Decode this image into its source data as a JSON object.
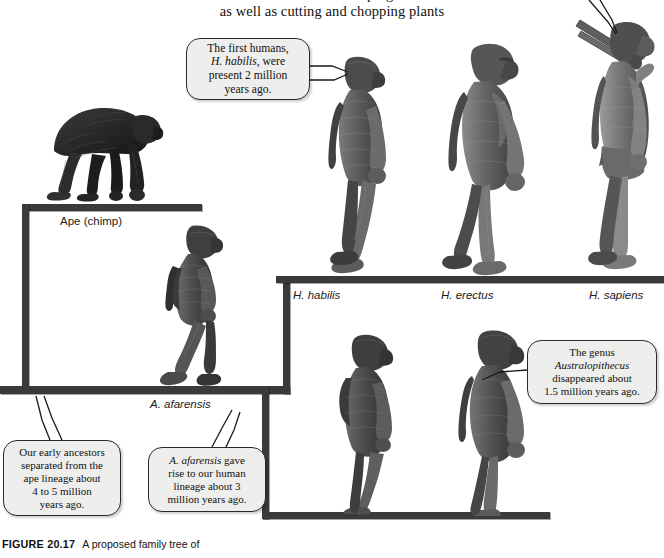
{
  "page": {
    "body_text_lines": [
      "tools were used for scraping animal",
      "as well as cutting and chopping plants"
    ]
  },
  "caption": {
    "figure_number": "FIGURE 20.17",
    "text": "A proposed family tree of"
  },
  "tree": {
    "labels": [
      {
        "id": "ape",
        "text": "Ape (chimp)",
        "italic": false,
        "x": 60,
        "y": 215
      },
      {
        "id": "afarensis",
        "text": "A. afarensis",
        "italic": true,
        "x": 150,
        "y": 398
      },
      {
        "id": "habilis",
        "text": "H. habilis",
        "italic": true,
        "x": 293,
        "y": 289
      },
      {
        "id": "erectus",
        "text": "H. erectus",
        "italic": true,
        "x": 441,
        "y": 289
      },
      {
        "id": "sapiens",
        "text": "H. sapiens",
        "italic": true,
        "x": 589,
        "y": 289
      }
    ]
  },
  "callouts": [
    {
      "id": "first-humans",
      "lines": [
        "The first humans,",
        "H. habilis, were",
        "present 2 million",
        "years ago."
      ],
      "italic_terms": [
        "H. habilis"
      ],
      "x": 186,
      "y": 38,
      "w": 124,
      "h": 62
    },
    {
      "id": "early-ancestors",
      "lines": [
        "Our early ancestors",
        "separated from the",
        "ape lineage about",
        "4 to 5 million",
        "years ago."
      ],
      "italic_terms": [],
      "x": 3,
      "y": 440,
      "w": 118,
      "h": 76
    },
    {
      "id": "afarensis-rise",
      "lines": [
        "A. afarensis gave",
        "rise to our human",
        "lineage about 3",
        "million years ago."
      ],
      "italic_terms": [
        "A. afarensis"
      ],
      "x": 148,
      "y": 447,
      "w": 118,
      "h": 65
    },
    {
      "id": "australopithecus-extinct",
      "lines": [
        "The genus",
        "Australopithecus",
        "disappeared about",
        "1.5 million years ago."
      ],
      "italic_terms": [
        "Australopithecus"
      ],
      "x": 527,
      "y": 340,
      "w": 130,
      "h": 64
    }
  ],
  "organisms": [
    {
      "id": "chimp",
      "name": "chimpanzee-knuckle-walking"
    },
    {
      "id": "afarensis-1",
      "name": "australopithecus-afarensis-standing"
    },
    {
      "id": "habilis",
      "name": "homo-habilis-walking"
    },
    {
      "id": "erectus",
      "name": "homo-erectus-walking"
    },
    {
      "id": "sapiens",
      "name": "homo-sapiens-with-tools"
    },
    {
      "id": "afarensis-2",
      "name": "australopithecus-afarensis-walking"
    },
    {
      "id": "afarensis-3",
      "name": "australopithecus-afarensis-walking"
    }
  ],
  "colors": {
    "bracket": "#3a3a3a",
    "bubble_fill": "#eeeeec",
    "bubble_stroke": "#2a2a2a",
    "figure_dark": "#4a4a4a",
    "figure_mid": "#7b7b7b",
    "figure_light": "#a9a9a9",
    "chimp_dark": "#2e2e2e"
  }
}
